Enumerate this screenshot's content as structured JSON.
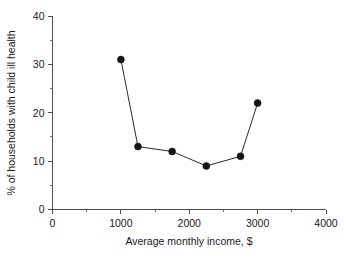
{
  "chart_data": {
    "type": "line",
    "title": "",
    "xlabel": "Average monthly income, $",
    "ylabel": "% of households with child ill health",
    "xlim": [
      0,
      4000
    ],
    "ylim": [
      0,
      40
    ],
    "x": [
      1000,
      1250,
      1750,
      2250,
      2750,
      3000
    ],
    "values": [
      31,
      13,
      12,
      9,
      11,
      22
    ],
    "series": [
      {
        "name": "% of households with child ill health",
        "x": [
          1000,
          1250,
          1750,
          2250,
          2750,
          3000
        ],
        "values": [
          31,
          13,
          12,
          9,
          11,
          22
        ]
      }
    ],
    "xticks": [
      0,
      1000,
      2000,
      3000,
      4000
    ],
    "xtick_labels": [
      "0",
      "1000",
      "2000",
      "3000",
      "4000"
    ],
    "xminor_ticks": [
      500,
      1500,
      2500,
      3500
    ],
    "yticks": [
      0,
      10,
      20,
      30,
      40
    ],
    "ytick_labels": [
      "0",
      "10",
      "20",
      "30",
      "40"
    ],
    "yminor_ticks": [
      5,
      15,
      25,
      35
    ],
    "grid": false,
    "legend": false,
    "legend_position": "none",
    "marker": "filled-circle",
    "line_color": "#2b2b2b",
    "marker_color": "#141414",
    "axis_color": "#4d4d4d",
    "background_color": "#ffffff"
  }
}
